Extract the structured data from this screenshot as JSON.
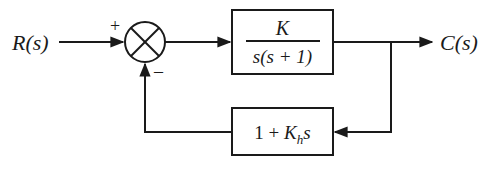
{
  "diagram": {
    "type": "control-system-block-diagram",
    "input_label": "R(s)",
    "output_label": "C(s)",
    "summing_junction": {
      "plus_sign": "+",
      "minus_sign": "–"
    },
    "forward_block": {
      "numerator": "K",
      "denominator": "s(s + 1)"
    },
    "feedback_block": {
      "prefix": "1 + ",
      "gain": "K",
      "subscript": "h",
      "suffix": "s"
    },
    "colors": {
      "stroke": "#1a1a1a",
      "background": "#ffffff"
    }
  }
}
